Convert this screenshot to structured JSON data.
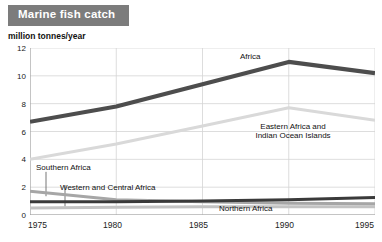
{
  "header": {
    "title": "Marine fish catch",
    "banner_color": "#7c7c7c"
  },
  "axis": {
    "unit_label": "million tonnes/year"
  },
  "annotations": {
    "africa": "Africa",
    "eastern_line1": "Eastern Africa and",
    "eastern_line2": "Indian Ocean Islands",
    "southern": "Southern Africa",
    "western_central": "Western and Central Africa",
    "northern": "Northern Africa"
  },
  "chart_data": {
    "type": "line",
    "title": "Marine fish catch",
    "xlabel": "",
    "ylabel": "million tonnes/year",
    "x": [
      1975,
      1980,
      1985,
      1990,
      1995
    ],
    "xlim": [
      1975,
      1995
    ],
    "ylim": [
      0,
      12
    ],
    "yticks": [
      0,
      2,
      4,
      6,
      8,
      10,
      12
    ],
    "xticks": [
      "1975",
      "1980",
      "1985",
      "1990",
      "1995"
    ],
    "grid": true,
    "legend": "inline-annotations",
    "series": [
      {
        "name": "Africa",
        "color": "#4d4d4d",
        "width": 4.2,
        "values": [
          6.7,
          7.8,
          9.4,
          11.0,
          10.2
        ]
      },
      {
        "name": "Eastern Africa and Indian Ocean Islands",
        "color": "#d9d9d9",
        "width": 3.0,
        "values": [
          4.0,
          5.1,
          6.4,
          7.7,
          6.8
        ]
      },
      {
        "name": "Western and Central Africa",
        "color": "#a6a6a6",
        "width": 3.0,
        "values": [
          1.7,
          1.1,
          0.95,
          0.85,
          0.8
        ]
      },
      {
        "name": "Northern Africa",
        "color": "#3a3a3a",
        "width": 3.0,
        "values": [
          0.95,
          0.95,
          1.0,
          1.1,
          1.25
        ]
      },
      {
        "name": "Southern Africa",
        "color": "#c2c2c2",
        "width": 3.0,
        "values": [
          0.5,
          0.55,
          0.6,
          0.6,
          0.6
        ]
      }
    ]
  }
}
